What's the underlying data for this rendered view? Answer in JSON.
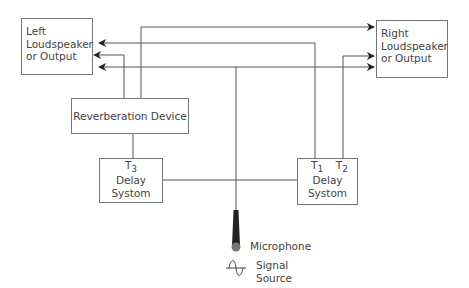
{
  "diagram": {
    "boxes": {
      "left_output": {
        "lines": [
          "Left",
          "Loudspeaker",
          "or Output"
        ]
      },
      "right_output": {
        "lines": [
          "Right",
          "Loudspeaker",
          "or Output"
        ]
      },
      "reverb": {
        "label": "Reverberation Device"
      },
      "delay_left": {
        "tap": "T",
        "tap_sub": "3",
        "lines": [
          "Delay",
          "Systom"
        ]
      },
      "delay_right": {
        "tap1": "T",
        "tap1_sub": "1",
        "tap2": "T",
        "tap2_sub": "2",
        "lines": [
          "Delay",
          "Systom"
        ]
      }
    },
    "microphone": {
      "label": "Microphone",
      "icon": "microphone-icon"
    },
    "signal_source": {
      "lines": [
        "Signal",
        "Source"
      ],
      "icon": "sine-wave-icon"
    },
    "colors": {
      "line": "#555555",
      "box_border": "#777777",
      "text": "#444444"
    }
  }
}
